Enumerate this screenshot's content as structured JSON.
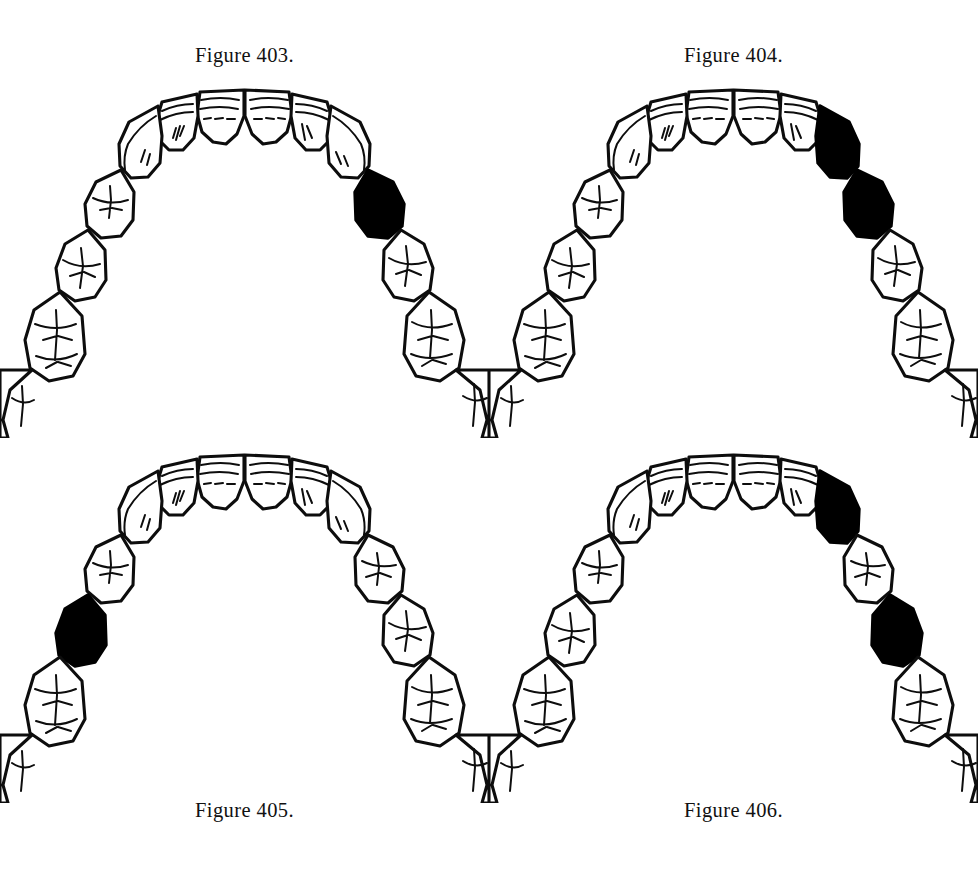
{
  "page": {
    "background_color": "#ffffff",
    "ink_color": "#0d0d0d",
    "shaded_tooth_color": "#000000",
    "width": 978,
    "height": 886
  },
  "figures": [
    {
      "id": "403",
      "caption": "Figure 403.",
      "caption_position": "top",
      "arch": "maxillary",
      "view": "occlusal",
      "tooth_count": 16,
      "shaded_teeth": [
        "right-first-premolar"
      ],
      "shaded_count": 1,
      "pattern": "single shaded tooth, right side"
    },
    {
      "id": "404",
      "caption": "Figure 404.",
      "caption_position": "top",
      "arch": "maxillary",
      "view": "occlusal",
      "tooth_count": 16,
      "shaded_teeth": [
        "right-canine",
        "right-first-premolar"
      ],
      "shaded_count": 2,
      "pattern": "two adjacent shaded teeth, right side"
    },
    {
      "id": "405",
      "caption": "Figure 405.",
      "caption_position": "bottom",
      "arch": "maxillary",
      "view": "occlusal",
      "tooth_count": 16,
      "shaded_teeth": [
        "left-second-premolar"
      ],
      "shaded_count": 1,
      "pattern": "single shaded tooth, left side"
    },
    {
      "id": "406",
      "caption": "Figure 406.",
      "caption_position": "bottom",
      "arch": "maxillary",
      "view": "occlusal",
      "tooth_count": 16,
      "shaded_teeth": [
        "right-canine",
        "right-second-premolar"
      ],
      "shaded_count": 2,
      "pattern": "two non-adjacent shaded teeth separated by an unshaded first premolar, right side"
    }
  ],
  "tooth_names": [
    "left-third-molar",
    "left-second-molar",
    "left-first-molar",
    "left-second-premolar",
    "left-first-premolar",
    "left-canine",
    "left-lateral-incisor",
    "left-central-incisor",
    "right-central-incisor",
    "right-lateral-incisor",
    "right-canine",
    "right-first-premolar",
    "right-second-premolar",
    "right-first-molar",
    "right-second-molar",
    "right-third-molar"
  ]
}
